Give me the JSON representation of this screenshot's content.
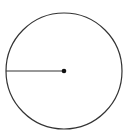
{
  "diagram": {
    "type": "circle-with-radius",
    "background": "#ffffff",
    "stroke_color": "#333333",
    "circle": {
      "cx": 64,
      "cy": 71,
      "r": 58,
      "stroke_width": 1.2
    },
    "radius_line": {
      "x1": 6,
      "y1": 71,
      "x2": 64,
      "y2": 71,
      "stroke_width": 1.2
    },
    "center_dot": {
      "cx": 64,
      "cy": 71,
      "r": 2.3,
      "fill": "#111111"
    }
  }
}
